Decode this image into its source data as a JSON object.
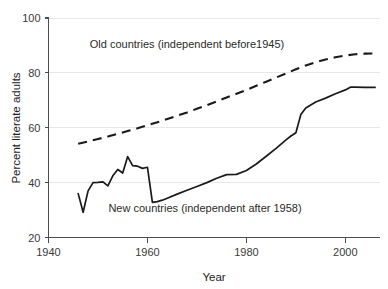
{
  "chart_data": {
    "type": "line",
    "title": "",
    "xlabel": "Year",
    "ylabel": "Percent literate adults",
    "xlim": [
      1940,
      2007
    ],
    "ylim": [
      20,
      100
    ],
    "xticks": [
      1940,
      1960,
      1980,
      2000
    ],
    "yticks": [
      20,
      40,
      60,
      80,
      100
    ],
    "xticklabels": [
      "1940",
      "1960",
      "1980",
      "2000"
    ],
    "yticklabels": [
      "20",
      "40",
      "60",
      "80",
      "100"
    ],
    "grid": "horizontal",
    "legend_position": "inline-annotations",
    "series": [
      {
        "name": "Old countries (independent before1945)",
        "style": "dashed",
        "color": "#1a1a1a",
        "annotation": "Old countries (independent before1945)",
        "x": [
          1946,
          1948,
          1950,
          1952,
          1954,
          1956,
          1958,
          1960,
          1962,
          1964,
          1966,
          1968,
          1970,
          1972,
          1974,
          1976,
          1978,
          1980,
          1982,
          1984,
          1986,
          1988,
          1990,
          1992,
          1994,
          1996,
          1998,
          2000,
          2002,
          2004,
          2006
        ],
        "values": [
          54.2,
          55.0,
          55.9,
          56.8,
          57.8,
          58.8,
          59.8,
          60.9,
          62.0,
          63.2,
          64.4,
          65.6,
          66.9,
          68.2,
          69.6,
          71.0,
          72.4,
          73.8,
          75.3,
          76.8,
          78.3,
          79.8,
          81.3,
          82.7,
          83.9,
          84.9,
          85.7,
          86.3,
          86.8,
          87.0,
          87.1
        ]
      },
      {
        "name": "New countries (independent after 1958)",
        "style": "solid",
        "color": "#1a1a1a",
        "annotation": "New countries (independent after 1958)",
        "x": [
          1946,
          1947,
          1948,
          1949,
          1950,
          1951,
          1952,
          1953,
          1954,
          1955,
          1956,
          1957,
          1958,
          1959,
          1960,
          1961,
          1962,
          1963,
          1964,
          1966,
          1968,
          1970,
          1972,
          1974,
          1976,
          1978,
          1980,
          1982,
          1984,
          1986,
          1988,
          1989,
          1990,
          1991,
          1992,
          1994,
          1996,
          1998,
          2000,
          2001,
          2002,
          2004,
          2006
        ],
        "values": [
          36.0,
          29.2,
          37.0,
          40.0,
          40.1,
          40.3,
          38.8,
          42.5,
          44.8,
          43.5,
          49.5,
          46.2,
          46.0,
          45.2,
          45.6,
          32.8,
          33.1,
          33.6,
          34.3,
          35.8,
          37.2,
          38.6,
          40.0,
          41.6,
          42.9,
          43.0,
          44.4,
          46.8,
          49.6,
          52.5,
          55.6,
          57.0,
          58.2,
          64.8,
          67.2,
          69.4,
          70.8,
          72.4,
          73.8,
          74.8,
          74.8,
          74.7,
          74.7
        ]
      }
    ],
    "annotations": [
      {
        "text": "Old countries (independent before1945)",
        "x_px": 187,
        "y_px": 48,
        "anchor": "middle"
      },
      {
        "text": "New countries (independent after 1958)",
        "x_px": 205,
        "y_px": 212,
        "anchor": "middle"
      }
    ]
  }
}
